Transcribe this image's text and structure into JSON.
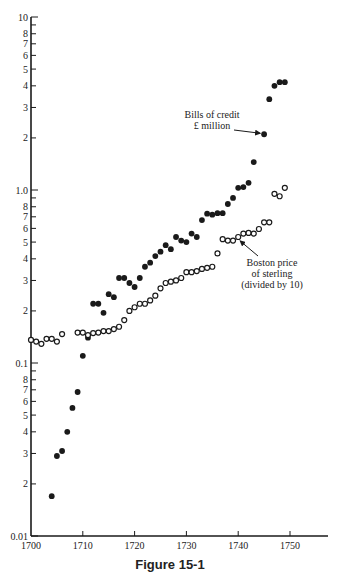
{
  "caption": "Figure 15-1",
  "chart_data": {
    "type": "scatter",
    "title": "",
    "xlabel": "",
    "ylabel": "",
    "yscale": "log",
    "xlim": [
      1700,
      1757
    ],
    "ylim": [
      0.01,
      10
    ],
    "grid": false,
    "x_ticks": [
      1700,
      1710,
      1720,
      1730,
      1740,
      1750
    ],
    "y_tick_labels": [
      {
        "v": 10,
        "label": "10"
      },
      {
        "v": 8,
        "label": "8"
      },
      {
        "v": 7,
        "label": "7"
      },
      {
        "v": 6,
        "label": "6"
      },
      {
        "v": 5,
        "label": "5"
      },
      {
        "v": 4,
        "label": "4"
      },
      {
        "v": 3,
        "label": "3"
      },
      {
        "v": 2,
        "label": "2"
      },
      {
        "v": 1.0,
        "label": "1.0"
      },
      {
        "v": 0.8,
        "label": "8"
      },
      {
        "v": 0.7,
        "label": "7"
      },
      {
        "v": 0.6,
        "label": "6"
      },
      {
        "v": 0.5,
        "label": "5"
      },
      {
        "v": 0.4,
        "label": "4"
      },
      {
        "v": 0.3,
        "label": "3"
      },
      {
        "v": 0.2,
        "label": "2"
      },
      {
        "v": 0.1,
        "label": "0.1"
      },
      {
        "v": 0.08,
        "label": "8"
      },
      {
        "v": 0.07,
        "label": "7"
      },
      {
        "v": 0.06,
        "label": "6"
      },
      {
        "v": 0.05,
        "label": "5"
      },
      {
        "v": 0.04,
        "label": "4"
      },
      {
        "v": 0.03,
        "label": "3"
      },
      {
        "v": 0.02,
        "label": "2"
      },
      {
        "v": 0.01,
        "label": "0.01"
      }
    ],
    "y_minor_unlabeled": [
      9,
      0.9,
      0.09
    ],
    "series": [
      {
        "name": "Bills of credit £ million",
        "marker": "filled-circle",
        "color": "#1a1a1a",
        "points": [
          [
            1704,
            0.017
          ],
          [
            1705,
            0.029
          ],
          [
            1706,
            0.031
          ],
          [
            1707,
            0.04
          ],
          [
            1708,
            0.055
          ],
          [
            1709,
            0.068
          ],
          [
            1710,
            0.11
          ],
          [
            1711,
            0.14
          ],
          [
            1712,
            0.22
          ],
          [
            1713,
            0.22
          ],
          [
            1714,
            0.195
          ],
          [
            1715,
            0.25
          ],
          [
            1716,
            0.24
          ],
          [
            1717,
            0.31
          ],
          [
            1718,
            0.31
          ],
          [
            1719,
            0.29
          ],
          [
            1720,
            0.275
          ],
          [
            1721,
            0.31
          ],
          [
            1722,
            0.36
          ],
          [
            1723,
            0.38
          ],
          [
            1724,
            0.415
          ],
          [
            1725,
            0.44
          ],
          [
            1726,
            0.48
          ],
          [
            1727,
            0.455
          ],
          [
            1728,
            0.535
          ],
          [
            1729,
            0.51
          ],
          [
            1730,
            0.5
          ],
          [
            1731,
            0.56
          ],
          [
            1732,
            0.535
          ],
          [
            1733,
            0.67
          ],
          [
            1734,
            0.73
          ],
          [
            1735,
            0.72
          ],
          [
            1736,
            0.735
          ],
          [
            1737,
            0.735
          ],
          [
            1738,
            0.83
          ],
          [
            1739,
            0.9
          ],
          [
            1740,
            1.03
          ],
          [
            1741,
            1.04
          ],
          [
            1742,
            1.1
          ],
          [
            1743,
            1.45
          ],
          [
            1745,
            2.1
          ],
          [
            1746,
            3.35
          ],
          [
            1747,
            4.0
          ],
          [
            1748,
            4.2
          ],
          [
            1749,
            4.2
          ]
        ]
      },
      {
        "name": "Boston price of sterling (divided by 10)",
        "marker": "open-circle",
        "color": "#1a1a1a",
        "points": [
          [
            1700,
            0.136
          ],
          [
            1701,
            0.133
          ],
          [
            1702,
            0.129
          ],
          [
            1703,
            0.138
          ],
          [
            1704,
            0.138
          ],
          [
            1705,
            0.133
          ],
          [
            1706,
            0.147
          ],
          [
            1709,
            0.15
          ],
          [
            1710,
            0.15
          ],
          [
            1711,
            0.145
          ],
          [
            1712,
            0.149
          ],
          [
            1713,
            0.15
          ],
          [
            1714,
            0.153
          ],
          [
            1715,
            0.153
          ],
          [
            1716,
            0.157
          ],
          [
            1717,
            0.162
          ],
          [
            1718,
            0.177
          ],
          [
            1719,
            0.2
          ],
          [
            1720,
            0.21
          ],
          [
            1721,
            0.22
          ],
          [
            1722,
            0.22
          ],
          [
            1723,
            0.23
          ],
          [
            1724,
            0.245
          ],
          [
            1725,
            0.27
          ],
          [
            1726,
            0.29
          ],
          [
            1727,
            0.295
          ],
          [
            1728,
            0.3
          ],
          [
            1729,
            0.31
          ],
          [
            1730,
            0.335
          ],
          [
            1731,
            0.335
          ],
          [
            1732,
            0.34
          ],
          [
            1733,
            0.35
          ],
          [
            1734,
            0.355
          ],
          [
            1735,
            0.36
          ],
          [
            1736,
            0.43
          ],
          [
            1737,
            0.52
          ],
          [
            1738,
            0.51
          ],
          [
            1739,
            0.51
          ],
          [
            1740,
            0.535
          ],
          [
            1741,
            0.56
          ],
          [
            1742,
            0.565
          ],
          [
            1743,
            0.56
          ],
          [
            1744,
            0.595
          ],
          [
            1745,
            0.65
          ],
          [
            1746,
            0.65
          ],
          [
            1747,
            0.95
          ],
          [
            1748,
            0.92
          ],
          [
            1749,
            1.03
          ]
        ]
      }
    ],
    "annotations": [
      {
        "lines": [
          "Bills of credit",
          "£ million"
        ],
        "x": 212,
        "y": 118,
        "arrow_to": [
          1745,
          2.1
        ]
      },
      {
        "lines": [
          "Boston price",
          "of sterling",
          "(divided by 10)"
        ],
        "x": 272,
        "y": 266,
        "arrow_to": [
          1740,
          0.535
        ]
      }
    ]
  }
}
